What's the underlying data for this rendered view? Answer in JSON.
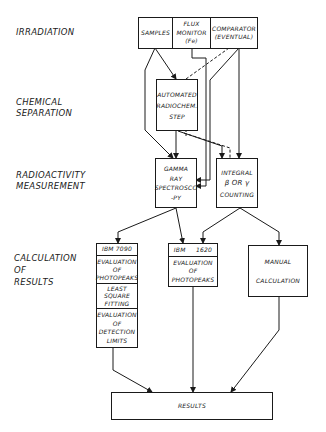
{
  "stages": [
    {
      "id": "irradiation",
      "label": "IRRADIATION"
    },
    {
      "id": "chemical",
      "label_lines": [
        "CHEMICAL",
        "SEPARATION"
      ]
    },
    {
      "id": "radioactivity",
      "label_lines": [
        "RADIOACTIVITY",
        "MEASUREMENT"
      ]
    },
    {
      "id": "calculation",
      "label_lines": [
        "CALCULATION",
        "OF",
        "RESULTS"
      ]
    }
  ],
  "irradiation_box": {
    "samples": "SAMPLES",
    "flux_monitor": [
      "FLUX",
      "MONITOR",
      "(Fe)"
    ],
    "comparator": [
      "COMPARATOR",
      "(EVENTUAL)"
    ]
  },
  "automated_step": [
    "AUTOMATED",
    "RADIOCHEM.",
    "STEP"
  ],
  "gamma_box": [
    "GAMMA",
    "RAY",
    "SPECTROSCO",
    "-PY"
  ],
  "integral_box": [
    "INTEGRAL",
    "β OR γ",
    "COUNTING"
  ],
  "ibm7090": {
    "header": "IBM 7090",
    "rows": [
      [
        "EVALUATION",
        "OF",
        "PHOTOPEAKS"
      ],
      [
        "LEAST",
        "SQUARE",
        "FITTING"
      ],
      [
        "EVALUATION",
        "OF",
        "DETECTION",
        "LIMITS"
      ]
    ]
  },
  "ibm1620": {
    "header": "IBM     1620",
    "rows": [
      [
        "EVALUATION",
        "OF",
        "PHOTOPEAKS"
      ]
    ]
  },
  "manual_box": [
    "MANUAL",
    "CALCULATION"
  ],
  "results_box": "RESULTS"
}
